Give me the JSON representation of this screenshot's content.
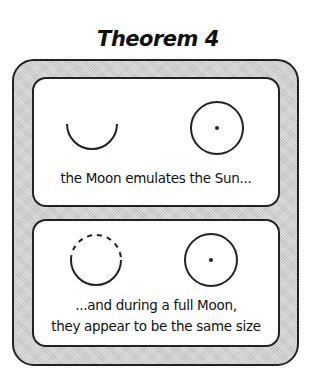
{
  "title": "Theorem 4",
  "panels": [
    {
      "caption": "the Moon emulates the Sun...",
      "figures": [
        {
          "type": "moon-arc",
          "icon": "half-moon-arc-icon"
        },
        {
          "type": "sun",
          "icon": "sun-circle-icon"
        }
      ]
    },
    {
      "caption_lines": [
        "...and during a full Moon,",
        "they appear to be the same size"
      ],
      "figures": [
        {
          "type": "moon-full-dashed-top",
          "icon": "full-moon-circle-icon"
        },
        {
          "type": "sun",
          "icon": "sun-circle-icon"
        }
      ]
    }
  ],
  "colors": {
    "stroke": "#222222",
    "frame_fill": "#cfcfcf",
    "panel_fill": "#ffffff"
  }
}
